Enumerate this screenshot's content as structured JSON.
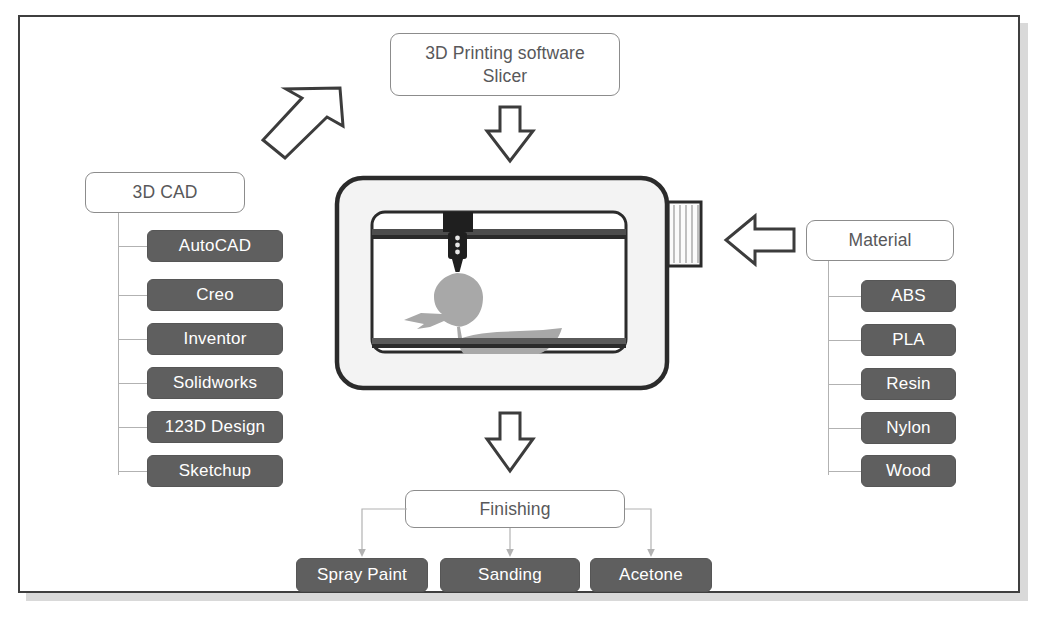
{
  "diagram": {
    "title_box": {
      "line1": "3D Printing software",
      "line2": "Slicer"
    },
    "cad": {
      "label": "3D CAD",
      "items": [
        {
          "label": "AutoCAD"
        },
        {
          "label": "Creo"
        },
        {
          "label": "Inventor"
        },
        {
          "label": "Solidworks"
        },
        {
          "label": "123D Design"
        },
        {
          "label": "Sketchup"
        }
      ]
    },
    "material": {
      "label": "Material",
      "items": [
        {
          "label": "ABS"
        },
        {
          "label": "PLA"
        },
        {
          "label": "Resin"
        },
        {
          "label": "Nylon"
        },
        {
          "label": "Wood"
        }
      ]
    },
    "finishing": {
      "label": "Finishing",
      "items": [
        {
          "label": "Spray Paint"
        },
        {
          "label": "Sanding"
        },
        {
          "label": "Acetone"
        }
      ]
    },
    "arrows": [
      {
        "name": "arrow-cad-to-slicer",
        "direction": "up-right"
      },
      {
        "name": "arrow-slicer-to-printer",
        "direction": "down"
      },
      {
        "name": "arrow-material-to-printer",
        "direction": "left"
      },
      {
        "name": "arrow-printer-to-finishing",
        "direction": "down"
      }
    ],
    "printer": {
      "name": "3d-printer-illustration",
      "parts": [
        "outer-shell",
        "build-chamber",
        "gantry-rail",
        "extruder-carriage",
        "extruder-nozzle",
        "build-plate",
        "printed-duck-model",
        "filament-spool"
      ]
    },
    "colors": {
      "frame_border": "#3f3f3f",
      "frame_shadow": "#d9d9d9",
      "outline_box_border": "#8c8c8c",
      "outline_box_text": "#58585a",
      "gray_box_fill": "#5f5f5f",
      "gray_box_text": "#ffffff",
      "connector_line": "#b2b2b2",
      "printer_shell": "#f2f2f2",
      "printer_outline": "#2b2b2b",
      "model_gray": "#a8a8a8",
      "background": "#ffffff"
    }
  }
}
